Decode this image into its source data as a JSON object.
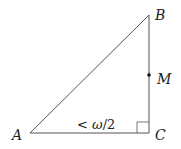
{
  "diagram": {
    "type": "right-triangle",
    "vertices": {
      "A": {
        "label": "A",
        "x": 30,
        "y": 133
      },
      "B": {
        "label": "B",
        "x": 149,
        "y": 15
      },
      "C": {
        "label": "C",
        "x": 149,
        "y": 133
      }
    },
    "points": {
      "M": {
        "label": "M",
        "x": 149,
        "y": 75
      }
    },
    "right_angle_at": "C",
    "angle_annotation": {
      "prefix": "<",
      "omega": "ω",
      "suffix": "/2",
      "full": "< ω/2"
    },
    "colors": {
      "stroke": "#555555",
      "text": "#222222"
    }
  }
}
